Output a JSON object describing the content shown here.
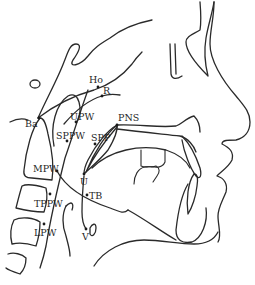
{
  "figure": {
    "type": "lateral cephalometric tracing",
    "background": "#ffffff",
    "line_color": "#2a2a2a"
  },
  "landmarks": [
    {
      "id": "Ho",
      "label": "Ho",
      "x": 99,
      "y": 87
    },
    {
      "id": "R",
      "label": "R",
      "x": 102,
      "y": 97
    },
    {
      "id": "Ba",
      "label": "Ba",
      "x": 38,
      "y": 118
    },
    {
      "id": "UPW",
      "label": "UPW",
      "x": 75,
      "y": 122
    },
    {
      "id": "PNS",
      "label": "PNS",
      "x": 117,
      "y": 125
    },
    {
      "id": "SPPW",
      "label": "SPPW",
      "x": 65,
      "y": 139
    },
    {
      "id": "SPP",
      "label": "SPP",
      "x": 95,
      "y": 140
    },
    {
      "id": "MPW",
      "label": "MPW",
      "x": 57,
      "y": 171
    },
    {
      "id": "U",
      "label": "U",
      "x": 84,
      "y": 174
    },
    {
      "id": "TB",
      "label": "TB",
      "x": 87,
      "y": 195
    },
    {
      "id": "TPPW",
      "label": "TPPW",
      "x": 50,
      "y": 204
    },
    {
      "id": "LPW",
      "label": "LPW",
      "x": 44,
      "y": 232
    },
    {
      "id": "V",
      "label": "V",
      "x": 86,
      "y": 229
    }
  ]
}
